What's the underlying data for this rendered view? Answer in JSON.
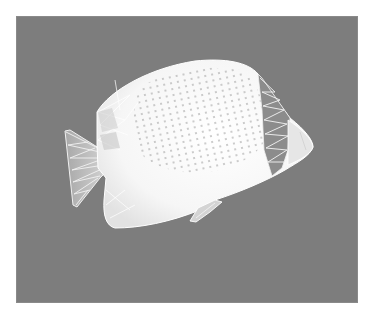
{
  "figure": {
    "colors": {
      "page_background": "#ffffff",
      "render_background": "#7d7d7d",
      "mesh_fill": "#f4f4f4",
      "mesh_edge": "#ffffff",
      "shadow_region": "#9a9a9a"
    }
  }
}
